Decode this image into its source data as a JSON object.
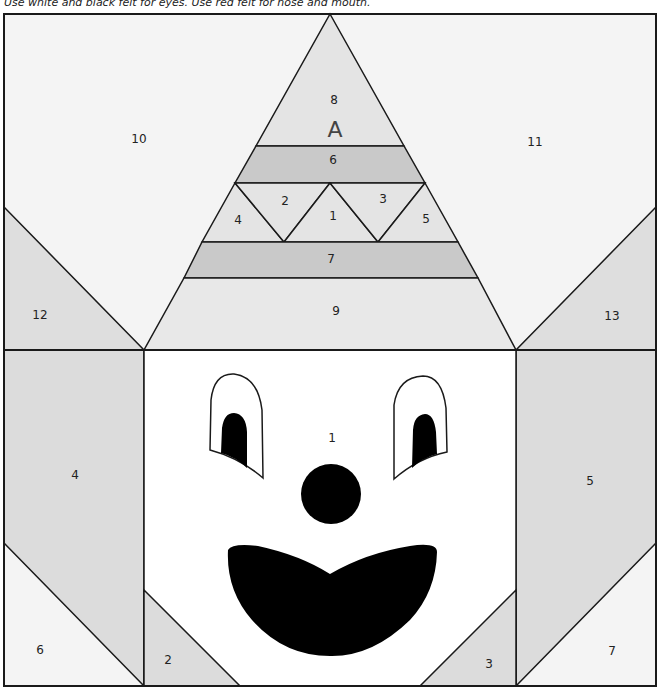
{
  "caption": "Use white and black felt for eyes. Use red felt for nose and mouth.",
  "colors": {
    "background_light": "#f4f4f4",
    "piece_light": "#e6e6e6",
    "piece_medium": "#dcdcdc",
    "piece_dark": "#c8c8c8",
    "face": "#ffffff",
    "felt_black": "#000000",
    "outline": "#1a1a1a"
  },
  "section_a": {
    "letter": "A",
    "pieces": {
      "p1": "1",
      "p2": "2",
      "p3": "3",
      "p4": "4",
      "p5": "5",
      "p6": "6",
      "p7": "7",
      "p8": "8",
      "p9": "9",
      "p10": "10",
      "p11": "11",
      "p12": "12",
      "p13": "13"
    }
  },
  "section_b": {
    "letter": "B",
    "pieces": {
      "p1": "1",
      "p2": "2",
      "p3": "3",
      "p4": "4",
      "p5": "5",
      "p6": "6",
      "p7": "7"
    }
  }
}
